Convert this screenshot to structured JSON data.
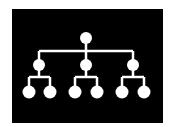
{
  "diagram": {
    "type": "hierarchy-tree",
    "background": "#000000",
    "page_background": "#ffffff",
    "foreground": "#ffffff",
    "frame": {
      "x": 12,
      "y": 9,
      "width": 151,
      "height": 114
    },
    "node_radius": {
      "root": 6,
      "mid": 6,
      "leaf": 6.5
    },
    "line_width": 2.5,
    "levels": 3,
    "root": {
      "x": 86,
      "y": 38
    },
    "level1_bar_y": 51,
    "mid_nodes": [
      {
        "x": 39,
        "y": 65,
        "children": [
          {
            "x": 29,
            "y": 92
          },
          {
            "x": 50,
            "y": 92
          }
        ]
      },
      {
        "x": 86,
        "y": 65,
        "children": [
          {
            "x": 75,
            "y": 92
          },
          {
            "x": 97,
            "y": 92
          }
        ]
      },
      {
        "x": 133,
        "y": 65,
        "children": [
          {
            "x": 122,
            "y": 92
          },
          {
            "x": 144,
            "y": 92
          }
        ]
      }
    ],
    "level2_bar_y": 77,
    "node_count": 10
  }
}
